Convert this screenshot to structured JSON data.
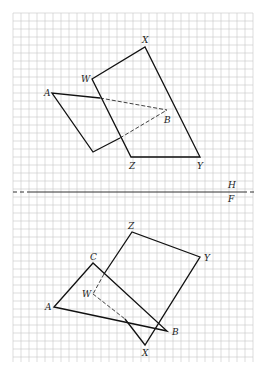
{
  "grid": {
    "x0": 13,
    "y0": 13,
    "x1": 253,
    "y1": 362,
    "step": 8,
    "color": "#c8c8c8"
  },
  "fold_line": {
    "y": 192,
    "label_top": "H",
    "label_bottom": "F"
  },
  "top_view": {
    "plane_WXYZ": {
      "W": [
        92,
        79
      ],
      "X": [
        145,
        47
      ],
      "Y": [
        200,
        157
      ],
      "Z": [
        131,
        157
      ]
    },
    "triangle_ABC": {
      "A": [
        52,
        93
      ],
      "B": [
        167,
        110
      ],
      "C_vertex": [
        93,
        152
      ]
    },
    "labels": {
      "A": "A",
      "B": "B",
      "W": "W",
      "X": "X",
      "Y": "Y",
      "Z": "Z"
    }
  },
  "front_view": {
    "plane_WXYZ": {
      "W": [
        93,
        294
      ],
      "X": [
        145,
        345
      ],
      "Y": [
        200,
        257
      ],
      "Z": [
        132,
        232
      ]
    },
    "triangle_ABC": {
      "A": [
        54,
        307
      ],
      "B": [
        167,
        331
      ],
      "C": [
        93,
        263
      ]
    },
    "labels": {
      "A": "A",
      "B": "B",
      "C": "C",
      "W": "W",
      "X": "X",
      "Y": "Y",
      "Z": "Z"
    }
  }
}
